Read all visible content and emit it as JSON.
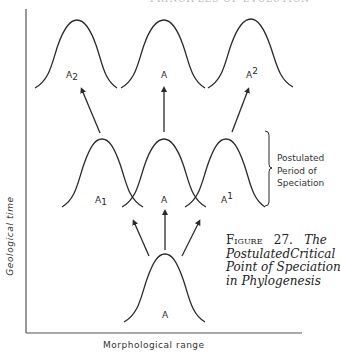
{
  "running_head": "PRINCIPLES OF EVOLUTION",
  "axes": {
    "y_label": "Geological time",
    "x_label": "Morphological range"
  },
  "curves": {
    "top_row": [
      {
        "label": "A",
        "sub": "2",
        "sup": ""
      },
      {
        "label": "A",
        "sub": "",
        "sup": ""
      },
      {
        "label": "A",
        "sub": "",
        "sup": "2"
      }
    ],
    "middle_row": [
      {
        "label": "A",
        "sub": "1",
        "sup": ""
      },
      {
        "label": "A",
        "sub": "",
        "sup": ""
      },
      {
        "label": "A",
        "sub": "",
        "sup": "1"
      }
    ],
    "bottom_row": [
      {
        "label": "A",
        "sub": "",
        "sup": ""
      }
    ]
  },
  "bracket": {
    "lines": [
      "Postulated",
      "Period of",
      "Speciation"
    ]
  },
  "caption": {
    "head": [
      "Figure",
      "27.",
      "The"
    ],
    "lines": [
      [
        "Postulated",
        "Critical"
      ],
      [
        "Point of Speciation"
      ],
      [
        "in Phylogenesis"
      ]
    ]
  },
  "colors": {
    "ink": "#2a2a2a",
    "background": "#ffffff"
  }
}
